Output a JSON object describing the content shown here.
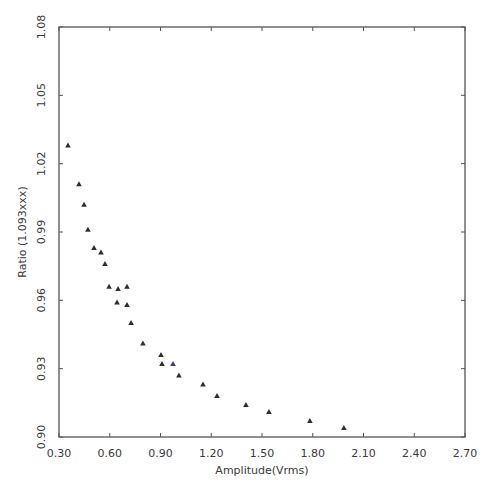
{
  "chart_data": {
    "type": "scatter",
    "title": "",
    "xlabel": "Amplitude(Vrms)",
    "ylabel": "Ratio  (1.093xxx)",
    "xlim": [
      0.3,
      2.7
    ],
    "ylim": [
      0.9,
      1.08
    ],
    "xticks": [
      "0.30",
      "0.60",
      "0.90",
      "1.20",
      "1.50",
      "1.80",
      "2.10",
      "2.40",
      "2.70"
    ],
    "yticks": [
      "0.90",
      "0.93",
      "0.96",
      "0.99",
      "1.02",
      "1.05",
      "1.08"
    ],
    "grid": false,
    "legend": null,
    "marker": "triangle",
    "series": [
      {
        "name": "Ratio",
        "color": "#333333",
        "x": [
          0.353,
          0.418,
          0.448,
          0.471,
          0.507,
          0.548,
          0.572,
          0.596,
          0.649,
          0.702,
          0.643,
          0.702,
          0.726,
          0.796,
          0.903,
          0.909,
          0.974,
          1.009,
          1.151,
          1.234,
          1.405,
          1.541,
          1.783,
          1.984
        ],
        "y": [
          1.028,
          1.011,
          1.002,
          0.991,
          0.983,
          0.981,
          0.976,
          0.966,
          0.965,
          0.966,
          0.959,
          0.958,
          0.95,
          0.941,
          0.936,
          0.932,
          0.932,
          0.927,
          0.923,
          0.918,
          0.914,
          0.911,
          0.907,
          0.904
        ]
      }
    ]
  },
  "colors": {
    "frame": "#555555",
    "marker": "#2e2e2e",
    "marker_alt": "#3a3a8a",
    "background": "#ffffff"
  }
}
